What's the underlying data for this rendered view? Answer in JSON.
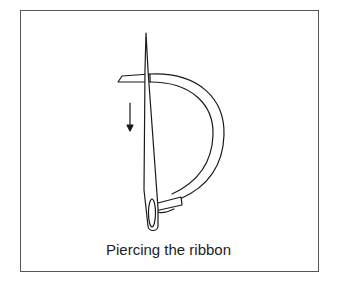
{
  "figure": {
    "caption": "Piercing the ribbon",
    "elements": {
      "needle": "needle piercing ribbon end",
      "ribbon": "ribbon threaded through needle eye, curving around",
      "arrow": "downward direction arrow"
    },
    "colors": {
      "stroke": "#1a1a1a",
      "frame": "#555555",
      "background": "#ffffff"
    }
  }
}
